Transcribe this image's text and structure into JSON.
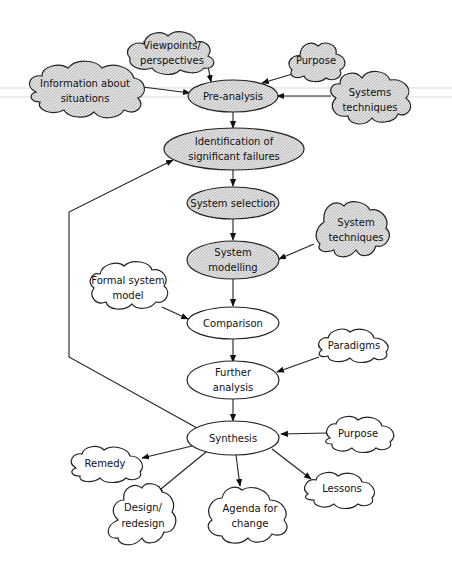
{
  "diagram": {
    "title": "",
    "colors": {
      "stroke": "#222222",
      "hatch_fill": "#d4d4d4",
      "plain_fill": "#ffffff"
    },
    "nodes": {
      "viewpoints": {
        "type": "cloud",
        "style": "hatched",
        "lines": [
          "Viewpoints/",
          "perspectives"
        ]
      },
      "information": {
        "type": "cloud",
        "style": "hatched",
        "lines": [
          "Information about",
          "situations"
        ]
      },
      "purpose_top": {
        "type": "cloud",
        "style": "hatched",
        "lines": [
          "Purpose"
        ]
      },
      "systems_techniques_top": {
        "type": "cloud",
        "style": "hatched",
        "lines": [
          "Systems",
          "techniques"
        ]
      },
      "pre_analysis": {
        "type": "ellipse",
        "style": "hatched",
        "lines": [
          "Pre-analysis"
        ]
      },
      "identification": {
        "type": "ellipse",
        "style": "hatched",
        "lines": [
          "Identification of",
          "significant failures"
        ]
      },
      "system_selection": {
        "type": "ellipse",
        "style": "hatched",
        "lines": [
          "System selection"
        ]
      },
      "system_techniques": {
        "type": "cloud",
        "style": "hatched",
        "lines": [
          "System",
          "techniques"
        ]
      },
      "system_modelling": {
        "type": "ellipse",
        "style": "hatched",
        "lines": [
          "System",
          "modelling"
        ]
      },
      "formal_system_model": {
        "type": "cloud",
        "style": "plain",
        "lines": [
          "Formal system",
          "model"
        ]
      },
      "comparison": {
        "type": "ellipse",
        "style": "plain",
        "lines": [
          "Comparison"
        ]
      },
      "paradigms": {
        "type": "cloud",
        "style": "plain",
        "lines": [
          "Paradigms"
        ]
      },
      "further_analysis": {
        "type": "ellipse",
        "style": "plain",
        "lines": [
          "Further",
          "analysis"
        ]
      },
      "synthesis": {
        "type": "ellipse",
        "style": "plain",
        "lines": [
          "Synthesis"
        ]
      },
      "purpose_bottom": {
        "type": "cloud",
        "style": "plain",
        "lines": [
          "Purpose"
        ]
      },
      "remedy": {
        "type": "cloud",
        "style": "plain",
        "lines": [
          "Remedy"
        ]
      },
      "design": {
        "type": "cloud",
        "style": "plain",
        "lines": [
          "Design/",
          "redesign"
        ]
      },
      "agenda": {
        "type": "cloud",
        "style": "plain",
        "lines": [
          "Agenda for",
          "change"
        ]
      },
      "lessons": {
        "type": "cloud",
        "style": "plain",
        "lines": [
          "Lessons"
        ]
      }
    },
    "edges": [
      {
        "from": "viewpoints",
        "to": "pre_analysis"
      },
      {
        "from": "information",
        "to": "pre_analysis"
      },
      {
        "from": "purpose_top",
        "to": "pre_analysis"
      },
      {
        "from": "systems_techniques_top",
        "to": "pre_analysis"
      },
      {
        "from": "pre_analysis",
        "to": "identification"
      },
      {
        "from": "identification",
        "to": "system_selection"
      },
      {
        "from": "system_selection",
        "to": "system_modelling"
      },
      {
        "from": "system_techniques",
        "to": "system_modelling"
      },
      {
        "from": "system_modelling",
        "to": "comparison"
      },
      {
        "from": "formal_system_model",
        "to": "comparison"
      },
      {
        "from": "comparison",
        "to": "further_analysis"
      },
      {
        "from": "paradigms",
        "to": "further_analysis"
      },
      {
        "from": "further_analysis",
        "to": "synthesis"
      },
      {
        "from": "purpose_bottom",
        "to": "synthesis"
      },
      {
        "from": "synthesis",
        "to": "remedy"
      },
      {
        "from": "synthesis",
        "to": "design"
      },
      {
        "from": "synthesis",
        "to": "agenda"
      },
      {
        "from": "synthesis",
        "to": "lessons"
      },
      {
        "from": "synthesis",
        "to": "identification",
        "note": "feedback loop"
      }
    ]
  }
}
